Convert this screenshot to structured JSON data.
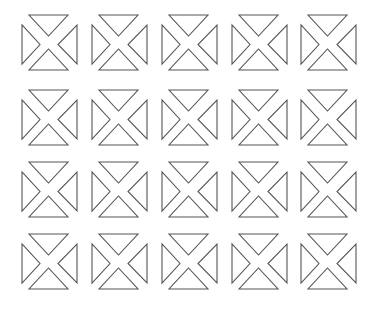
{
  "grid": {
    "rows": 4,
    "cols": 5,
    "col_x": [
      21,
      91,
      161,
      231,
      300
    ],
    "row_y": [
      14,
      89,
      161,
      233
    ],
    "stroke_color": "#555555",
    "background_color": "#ffffff"
  },
  "icons": [
    {
      "name": "placeholder-image-icon",
      "row": 0,
      "col": 0
    },
    {
      "name": "placeholder-image-icon",
      "row": 0,
      "col": 1
    },
    {
      "name": "placeholder-image-icon",
      "row": 0,
      "col": 2
    },
    {
      "name": "placeholder-image-icon",
      "row": 0,
      "col": 3
    },
    {
      "name": "placeholder-image-icon",
      "row": 0,
      "col": 4
    },
    {
      "name": "placeholder-image-icon",
      "row": 1,
      "col": 0
    },
    {
      "name": "placeholder-image-icon",
      "row": 1,
      "col": 1
    },
    {
      "name": "placeholder-image-icon",
      "row": 1,
      "col": 2
    },
    {
      "name": "placeholder-image-icon",
      "row": 1,
      "col": 3
    },
    {
      "name": "placeholder-image-icon",
      "row": 1,
      "col": 4
    },
    {
      "name": "placeholder-image-icon",
      "row": 2,
      "col": 0
    },
    {
      "name": "placeholder-image-icon",
      "row": 2,
      "col": 1
    },
    {
      "name": "placeholder-image-icon",
      "row": 2,
      "col": 2
    },
    {
      "name": "placeholder-image-icon",
      "row": 2,
      "col": 3
    },
    {
      "name": "placeholder-image-icon",
      "row": 2,
      "col": 4
    },
    {
      "name": "placeholder-image-icon",
      "row": 3,
      "col": 0
    },
    {
      "name": "placeholder-image-icon",
      "row": 3,
      "col": 1
    },
    {
      "name": "placeholder-image-icon",
      "row": 3,
      "col": 2
    },
    {
      "name": "placeholder-image-icon",
      "row": 3,
      "col": 3
    },
    {
      "name": "placeholder-image-icon",
      "row": 3,
      "col": 4
    }
  ]
}
